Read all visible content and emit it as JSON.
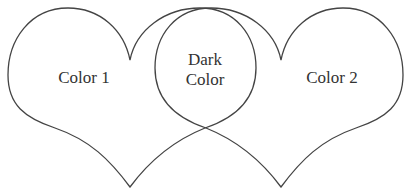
{
  "diagram": {
    "type": "overlapping-hearts-venn",
    "title_partial": "",
    "left_heart": {
      "label": "Color 1"
    },
    "right_heart": {
      "label": "Color 2"
    },
    "overlap": {
      "label_line1": "Dark",
      "label_line2": "Color"
    },
    "stroke_color": "#444444",
    "background": "#ffffff"
  }
}
